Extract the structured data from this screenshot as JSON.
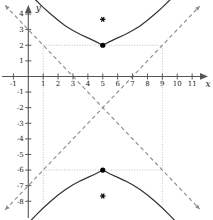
{
  "figure": {
    "kind": "hyperbola-graph",
    "background_color": "#ffffff",
    "axis_color": "#555555",
    "curve_color": "#333333",
    "asymptote_color": "#8a8a8a",
    "guide_color": "#b9b9b9",
    "point_color": "#000000",
    "label_color": "#222222"
  },
  "axes": {
    "x_label": "x",
    "y_label": "y",
    "x_min": -1.9,
    "x_max": 12.4,
    "y_min": -9.2,
    "y_max": 4.9,
    "x_ticks": [
      -1,
      1,
      2,
      3,
      4,
      5,
      6,
      7,
      8,
      9,
      10,
      11
    ],
    "y_ticks": [
      -8,
      -7,
      -6,
      -5,
      -4,
      -3,
      -2,
      -1,
      1,
      2,
      3,
      4
    ],
    "x_tick_labels": [
      "-1",
      "1",
      "2",
      "3",
      "4",
      "5",
      "6",
      "7",
      "8",
      "9",
      "10",
      "11"
    ],
    "y_tick_labels": [
      "-8",
      "-7",
      "-6",
      "-5",
      "-4",
      "-3",
      "-2",
      "-1",
      "1",
      "2",
      "3",
      "4"
    ],
    "arrows": [
      "x-positive",
      "y-positive"
    ]
  },
  "chart_data": {
    "type": "line",
    "title": "",
    "xlabel": "x",
    "ylabel": "y",
    "xlim": [
      -1.9,
      12.4
    ],
    "ylim": [
      -9.2,
      4.9
    ],
    "grid": false,
    "legend": "none",
    "curve_type": "hyperbola",
    "orientation": "vertical-transverse-axis",
    "equation": "(y + 2)^2/16 - (x - 5)^2/16 = 1",
    "center": [
      5,
      -2
    ],
    "a": 4,
    "b": 4,
    "vertices": [
      {
        "label": "upper-vertex",
        "x": 5,
        "y": 2
      },
      {
        "label": "lower-vertex",
        "x": 5,
        "y": -6
      }
    ],
    "foci": [
      {
        "label": "upper-focus",
        "x": 5,
        "y": 3.66
      },
      {
        "label": "lower-focus",
        "x": 5,
        "y": -7.66
      }
    ],
    "asymptotes": [
      {
        "label": "asymptote-positive-slope",
        "slope": 1,
        "intercept": -7
      },
      {
        "label": "asymptote-negative-slope",
        "slope": -1,
        "intercept": 3
      }
    ],
    "guide_box": {
      "x_left": 1,
      "x_right": 9,
      "y_top": 2,
      "y_bottom": -6
    },
    "series": [
      {
        "name": "upper-branch",
        "points": [
          [
            -1.0,
            6.49
          ],
          [
            -0.5,
            5.93
          ],
          [
            0.0,
            5.4
          ],
          [
            0.5,
            4.9
          ],
          [
            1.0,
            4.43
          ],
          [
            1.5,
            4.0
          ],
          [
            2.0,
            3.6
          ],
          [
            2.5,
            3.24
          ],
          [
            3.0,
            2.94
          ],
          [
            3.5,
            2.69
          ],
          [
            4.0,
            2.47
          ],
          [
            4.5,
            2.25
          ],
          [
            5.0,
            2.0
          ],
          [
            5.5,
            2.25
          ],
          [
            6.0,
            2.47
          ],
          [
            6.5,
            2.69
          ],
          [
            7.0,
            2.94
          ],
          [
            7.5,
            3.24
          ],
          [
            8.0,
            3.6
          ],
          [
            8.5,
            4.0
          ],
          [
            9.0,
            4.43
          ],
          [
            9.5,
            4.9
          ],
          [
            10.0,
            5.4
          ],
          [
            10.5,
            5.93
          ],
          [
            11.0,
            6.49
          ]
        ]
      },
      {
        "name": "lower-branch",
        "points": [
          [
            -1.0,
            -10.49
          ],
          [
            -0.5,
            -9.93
          ],
          [
            0.0,
            -9.4
          ],
          [
            0.5,
            -8.9
          ],
          [
            1.0,
            -8.43
          ],
          [
            1.5,
            -8.0
          ],
          [
            2.0,
            -7.6
          ],
          [
            2.5,
            -7.24
          ],
          [
            3.0,
            -6.94
          ],
          [
            3.5,
            -6.69
          ],
          [
            4.0,
            -6.47
          ],
          [
            4.5,
            -6.25
          ],
          [
            5.0,
            -6.0
          ],
          [
            5.5,
            -6.25
          ],
          [
            6.0,
            -6.47
          ],
          [
            6.5,
            -6.69
          ],
          [
            7.0,
            -6.94
          ],
          [
            7.5,
            -7.24
          ],
          [
            8.0,
            -7.6
          ],
          [
            8.5,
            -8.0
          ],
          [
            9.0,
            -8.43
          ],
          [
            9.5,
            -8.9
          ],
          [
            10.0,
            -9.4
          ],
          [
            10.5,
            -9.93
          ],
          [
            11.0,
            -10.49
          ]
        ]
      }
    ]
  }
}
